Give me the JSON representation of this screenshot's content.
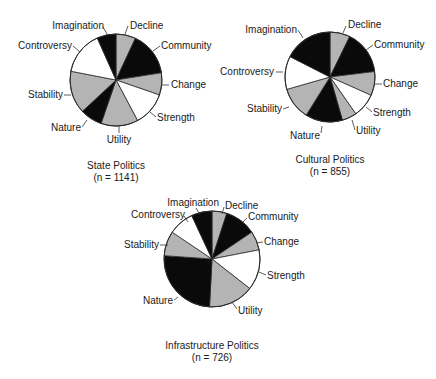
{
  "colors": {
    "gray": "#b4b4b4",
    "black": "#0a0a0a",
    "white": "#ffffff",
    "stroke": "#2a2a2a"
  },
  "chart_data": [
    {
      "type": "pie",
      "title": "State Politics",
      "n_label": "(n = 1141)",
      "n": 1141,
      "center": [
        116,
        80
      ],
      "radius": 46,
      "start_angle_deg": 0,
      "direction": "clockwise",
      "categories": [
        "Decline",
        "Community",
        "Change",
        "Strength",
        "Utility",
        "Nature",
        "Stability",
        "Controversy",
        "Imagination"
      ],
      "angles_deg": [
        25,
        56,
        28,
        43,
        47,
        28,
        54,
        55,
        24
      ],
      "values_pct": [
        6.9,
        15.6,
        7.8,
        11.9,
        13.1,
        7.8,
        15.0,
        15.3,
        6.7
      ],
      "fills": [
        "gray",
        "black",
        "gray",
        "white",
        "gray",
        "black",
        "gray",
        "white",
        "black"
      ],
      "labels": [
        {
          "text": "Decline",
          "x": 130,
          "y": 29,
          "anchor": "start",
          "lx1": 128,
          "ly1": 26,
          "lx2": 125,
          "ly2": 34
        },
        {
          "text": "Community",
          "x": 161,
          "y": 49,
          "anchor": "start",
          "lx1": 160,
          "ly1": 46,
          "lx2": 153,
          "ly2": 51
        },
        {
          "text": "Change",
          "x": 171,
          "y": 88,
          "anchor": "start",
          "lx1": 169,
          "ly1": 85,
          "lx2": 162,
          "ly2": 85
        },
        {
          "text": "Strength",
          "x": 157,
          "y": 121,
          "anchor": "start",
          "lx1": 156,
          "ly1": 117,
          "lx2": 150,
          "ly2": 112
        },
        {
          "text": "Utility",
          "x": 119,
          "y": 143,
          "anchor": "middle",
          "lx1": 119,
          "ly1": 133,
          "lx2": 119,
          "ly2": 126
        },
        {
          "text": "Nature",
          "x": 81,
          "y": 131,
          "anchor": "end",
          "lx1": 82,
          "ly1": 127,
          "lx2": 87,
          "ly2": 120
        },
        {
          "text": "Stability",
          "x": 63,
          "y": 98,
          "anchor": "end",
          "lx1": 64,
          "ly1": 95,
          "lx2": 71,
          "ly2": 95
        },
        {
          "text": "Controversy",
          "x": 72,
          "y": 49,
          "anchor": "end",
          "lx1": 73,
          "ly1": 46,
          "lx2": 80,
          "ly2": 52
        },
        {
          "text": "Imagination",
          "x": 104,
          "y": 29,
          "anchor": "end",
          "lx1": 103,
          "ly1": 27,
          "lx2": 107,
          "ly2": 34
        }
      ]
    },
    {
      "type": "pie",
      "title": "Cultural Politics",
      "n_label": "(n = 855)",
      "n": 855,
      "center": [
        330,
        77
      ],
      "radius": 45,
      "start_angle_deg": 0,
      "direction": "clockwise",
      "categories": [
        "Decline",
        "Community",
        "Change",
        "Strength",
        "Utility",
        "Nature",
        "Stability",
        "Controversy",
        "Imagination"
      ],
      "angles_deg": [
        26,
        57,
        31,
        31,
        19,
        48,
        42,
        43,
        63
      ],
      "values_pct": [
        7.2,
        15.8,
        8.6,
        8.6,
        5.3,
        13.3,
        11.7,
        11.9,
        17.5
      ],
      "fills": [
        "gray",
        "black",
        "gray",
        "white",
        "gray",
        "black",
        "gray",
        "white",
        "black"
      ],
      "labels": [
        {
          "text": "Decline",
          "x": 348,
          "y": 28,
          "anchor": "start",
          "lx1": 346,
          "ly1": 26,
          "lx2": 343,
          "ly2": 33
        },
        {
          "text": "Community",
          "x": 374,
          "y": 48,
          "anchor": "start",
          "lx1": 373,
          "ly1": 45,
          "lx2": 366,
          "ly2": 50
        },
        {
          "text": "Change",
          "x": 383,
          "y": 87,
          "anchor": "start",
          "lx1": 382,
          "ly1": 84,
          "lx2": 375,
          "ly2": 84
        },
        {
          "text": "Strength",
          "x": 373,
          "y": 116,
          "anchor": "start",
          "lx1": 372,
          "ly1": 112,
          "lx2": 366,
          "ly2": 107
        },
        {
          "text": "Utility",
          "x": 356,
          "y": 134,
          "anchor": "start",
          "lx1": 355,
          "ly1": 130,
          "lx2": 352,
          "ly2": 120
        },
        {
          "text": "Nature",
          "x": 320,
          "y": 139,
          "anchor": "end",
          "lx1": 321,
          "ly1": 133,
          "lx2": 322,
          "ly2": 126
        },
        {
          "text": "Stability",
          "x": 282,
          "y": 112,
          "anchor": "end",
          "lx1": 283,
          "ly1": 109,
          "lx2": 289,
          "ly2": 107
        },
        {
          "text": "Controversy",
          "x": 274,
          "y": 75,
          "anchor": "end",
          "lx1": 276,
          "ly1": 72,
          "lx2": 283,
          "ly2": 72
        },
        {
          "text": "Imagination",
          "x": 297,
          "y": 33,
          "anchor": "end",
          "lx1": 298,
          "ly1": 30,
          "lx2": 303,
          "ly2": 38
        }
      ]
    },
    {
      "type": "pie",
      "title": "Infrastructure Politics",
      "n_label": "(n = 726)",
      "n": 726,
      "center": [
        212,
        259
      ],
      "radius": 48,
      "start_angle_deg": 0,
      "direction": "clockwise",
      "categories": [
        "Decline",
        "Community",
        "Change",
        "Strength",
        "Utility",
        "Nature",
        "Stability",
        "Controversy",
        "Imagination"
      ],
      "angles_deg": [
        18,
        38,
        23,
        49,
        55,
        91,
        30,
        31,
        25
      ],
      "values_pct": [
        5.0,
        10.6,
        6.4,
        13.6,
        15.3,
        25.3,
        8.3,
        8.6,
        6.9
      ],
      "fills": [
        "gray",
        "black",
        "gray",
        "white",
        "gray",
        "black",
        "gray",
        "white",
        "black"
      ],
      "labels": [
        {
          "text": "Decline",
          "x": 225,
          "y": 209,
          "anchor": "start",
          "lx1": 224,
          "ly1": 207,
          "lx2": 222,
          "ly2": 214
        },
        {
          "text": "Community",
          "x": 248,
          "y": 220,
          "anchor": "start",
          "lx1": 247,
          "ly1": 218,
          "lx2": 242,
          "ly2": 223
        },
        {
          "text": "Change",
          "x": 264,
          "y": 245,
          "anchor": "start",
          "lx1": 263,
          "ly1": 242,
          "lx2": 257,
          "ly2": 243
        },
        {
          "text": "Strength",
          "x": 267,
          "y": 279,
          "anchor": "start",
          "lx1": 266,
          "ly1": 275,
          "lx2": 259,
          "ly2": 272
        },
        {
          "text": "Utility",
          "x": 238,
          "y": 314,
          "anchor": "start",
          "lx1": 237,
          "ly1": 309,
          "lx2": 232,
          "ly2": 302
        },
        {
          "text": "Nature",
          "x": 173,
          "y": 304,
          "anchor": "end",
          "lx1": 174,
          "ly1": 300,
          "lx2": 178,
          "ly2": 297
        },
        {
          "text": "Stability",
          "x": 159,
          "y": 248,
          "anchor": "end",
          "lx1": 160,
          "ly1": 245,
          "lx2": 168,
          "ly2": 245
        },
        {
          "text": "Controversy",
          "x": 185,
          "y": 218,
          "anchor": "end",
          "lx1": 184,
          "ly1": 216,
          "lx2": 188,
          "ly2": 222
        },
        {
          "text": "Imagination",
          "x": 219,
          "y": 206,
          "anchor": "end",
          "lx1": 196,
          "ly1": 208,
          "lx2": 200,
          "ly2": 215
        }
      ]
    }
  ],
  "captions": [
    {
      "title": "State Politics",
      "n_label": "(n = 1141)"
    },
    {
      "title": "Cultural Politics",
      "n_label": "(n = 855)"
    },
    {
      "title": "Infrastructure Politics",
      "n_label": "(n = 726)"
    }
  ]
}
